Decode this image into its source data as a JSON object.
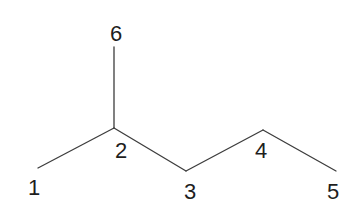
{
  "diagram": {
    "kind": "skeletal-structure",
    "background": "#ffffff",
    "line_color": "#3d3d3d",
    "line_width": 1.3,
    "label_color": "#1e1e1e",
    "bonds": [
      {
        "name": "bond-c1-c2",
        "x1": 38,
        "y1": 168,
        "x2": 114,
        "y2": 128
      },
      {
        "name": "bond-c2-c3",
        "x1": 114,
        "y1": 128,
        "x2": 186,
        "y2": 171
      },
      {
        "name": "bond-c3-c4",
        "x1": 186,
        "y1": 171,
        "x2": 263,
        "y2": 130
      },
      {
        "name": "bond-c4-c5",
        "x1": 263,
        "y1": 130,
        "x2": 336,
        "y2": 171
      },
      {
        "name": "bond-c2-c6",
        "x1": 114,
        "y1": 128,
        "x2": 114,
        "y2": 47
      }
    ],
    "labels": [
      {
        "text": "1",
        "x": 34,
        "y": 195
      },
      {
        "text": "2",
        "x": 121,
        "y": 158
      },
      {
        "text": "3",
        "x": 190,
        "y": 199
      },
      {
        "text": "4",
        "x": 261,
        "y": 158
      },
      {
        "text": "5",
        "x": 333,
        "y": 199
      },
      {
        "text": "6",
        "x": 116,
        "y": 41
      }
    ]
  }
}
